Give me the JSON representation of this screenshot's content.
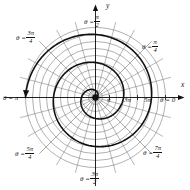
{
  "figure": {
    "title": "",
    "axis_labels": {
      "x": "x",
      "y": "y"
    },
    "origin_marker": "center-dot"
  },
  "angle_labels": [
    {
      "name": "theta-0",
      "text": "θ = 0",
      "lead": "θ =",
      "num": "",
      "den": "",
      "plain": "0",
      "deg": 0,
      "x": 160,
      "y": 97
    },
    {
      "name": "theta-pi-4",
      "text": "θ = π/4",
      "lead": "θ =",
      "num": "π",
      "den": "4",
      "plain": "",
      "deg": 45,
      "x": 142,
      "y": 39
    },
    {
      "name": "theta-pi-2",
      "text": "θ = π/2",
      "lead": "θ =",
      "num": "π",
      "den": "2",
      "plain": "",
      "deg": 90,
      "x": 84,
      "y": 14
    },
    {
      "name": "theta-3pi-4",
      "text": "θ = 3π/4",
      "lead": "θ =",
      "num": "3π",
      "den": "4",
      "plain": "",
      "deg": 135,
      "x": 16,
      "y": 30
    },
    {
      "name": "theta-pi",
      "text": "θ = π",
      "lead": "θ =",
      "num": "",
      "den": "",
      "plain": "π",
      "deg": 180,
      "x": 3,
      "y": 95
    },
    {
      "name": "theta-5pi-4",
      "text": "θ = 5π/4",
      "lead": "θ =",
      "num": "5π",
      "den": "4",
      "plain": "",
      "deg": 225,
      "x": 15,
      "y": 146
    },
    {
      "name": "theta-3pi-2",
      "text": "θ = 3π/2",
      "lead": "θ =",
      "num": "3π",
      "den": "2",
      "plain": "",
      "deg": 270,
      "x": 80,
      "y": 171
    },
    {
      "name": "theta-7pi-4",
      "text": "θ = 7π/4",
      "lead": "θ =",
      "num": "7π",
      "den": "4",
      "plain": "",
      "deg": 315,
      "x": 143,
      "y": 145
    }
  ],
  "radial_ticks": [
    {
      "name": "tick-pi",
      "label": "π",
      "r_value": 3.1416,
      "x": 107,
      "y": 97
    },
    {
      "name": "tick-3pi",
      "label": "3π",
      "r_value": 9.4248,
      "x": 124,
      "y": 97
    },
    {
      "name": "tick-5pi",
      "label": "5π",
      "r_value": 15.708,
      "x": 144,
      "y": 97
    }
  ],
  "chart_data": {
    "type": "line",
    "coordinate_system": "polar",
    "title": "",
    "subtitle": "",
    "xlabel": "x",
    "ylabel": "y",
    "curve_equation": "r = θ",
    "curve_name": "Archimedean spiral",
    "theta_range": [
      0,
      15.708
    ],
    "r_range": [
      0,
      15.708
    ],
    "rlim": [
      0,
      17.5
    ],
    "grid": true,
    "grid_circles_r": [
      1.5708,
      3.1416,
      4.7124,
      6.2832,
      7.854,
      9.4248,
      10.9956,
      12.5664,
      14.1372,
      15.708
    ],
    "grid_spokes_deg": [
      0,
      15,
      30,
      45,
      60,
      75,
      90,
      105,
      120,
      135,
      150,
      165,
      180,
      195,
      210,
      225,
      240,
      255,
      270,
      285,
      300,
      315,
      330,
      345
    ],
    "legend": "none",
    "legend_position": "none",
    "annotations": [
      {
        "name": "direction-arrowhead",
        "text": "",
        "theta_deg": 225,
        "r_value": 15.708
      }
    ],
    "series": [
      {
        "name": "r = θ",
        "color": "#111111",
        "linewidth": 1.6,
        "points_polar": [
          {
            "theta": 0.0,
            "r": 0.0
          },
          {
            "theta": 0.7854,
            "r": 0.7854
          },
          {
            "theta": 1.5708,
            "r": 1.5708
          },
          {
            "theta": 2.3562,
            "r": 2.3562
          },
          {
            "theta": 3.1416,
            "r": 3.1416
          },
          {
            "theta": 3.927,
            "r": 3.927
          },
          {
            "theta": 4.7124,
            "r": 4.7124
          },
          {
            "theta": 5.4978,
            "r": 5.4978
          },
          {
            "theta": 6.2832,
            "r": 6.2832
          },
          {
            "theta": 7.0686,
            "r": 7.0686
          },
          {
            "theta": 7.854,
            "r": 7.854
          },
          {
            "theta": 8.6394,
            "r": 8.6394
          },
          {
            "theta": 9.4248,
            "r": 9.4248
          },
          {
            "theta": 10.2102,
            "r": 10.2102
          },
          {
            "theta": 10.9956,
            "r": 10.9956
          },
          {
            "theta": 11.781,
            "r": 11.781
          },
          {
            "theta": 12.5664,
            "r": 12.5664
          },
          {
            "theta": 13.3518,
            "r": 13.3518
          },
          {
            "theta": 14.1372,
            "r": 14.1372
          },
          {
            "theta": 14.9226,
            "r": 14.9226
          },
          {
            "theta": 15.708,
            "r": 15.708
          }
        ]
      }
    ]
  }
}
